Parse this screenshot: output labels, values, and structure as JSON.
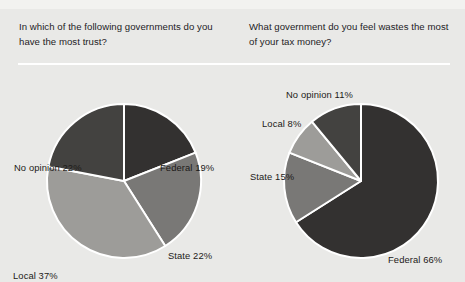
{
  "page": {
    "background_color": "#e9e9e7",
    "divider_color": "#ffffff",
    "cropped_top_text": ""
  },
  "questions": {
    "left": "In which of the following governments do you have the most trust?",
    "right": "What government do you feel wastes the most of your tax money?"
  },
  "colors": {
    "federal": "#333130",
    "no_opinion": "#434240",
    "state": "#797876",
    "local": "#9d9c99",
    "slice_border": "#ffffff",
    "label_text": "#1c1a18"
  },
  "chart_data": [
    {
      "type": "pie",
      "title": "In which of the following governments do you have the most trust?",
      "labels": [
        "Federal",
        "State",
        "Local",
        "No opinion"
      ],
      "values": [
        19,
        22,
        37,
        22
      ],
      "unit": "%",
      "data_labels": [
        "Federal 19%",
        "State 22%",
        "Local 37%",
        "No opinion 22%"
      ],
      "colors": [
        "#333130",
        "#797876",
        "#9d9c99",
        "#434240"
      ],
      "start_angle_deg": 0,
      "direction": "clockwise",
      "legend": "none",
      "grid": false
    },
    {
      "type": "pie",
      "title": "What government do you feel wastes the most of your tax money?",
      "labels": [
        "Federal",
        "State",
        "Local",
        "No opinion"
      ],
      "values": [
        66,
        15,
        8,
        11
      ],
      "unit": "%",
      "data_labels": [
        "Federal 66%",
        "State 15%",
        "Local 8%",
        "No opinion 11%"
      ],
      "colors": [
        "#333130",
        "#797876",
        "#9d9c99",
        "#434240"
      ],
      "start_angle_deg": 0,
      "direction": "clockwise",
      "legend": "none",
      "grid": false
    }
  ]
}
